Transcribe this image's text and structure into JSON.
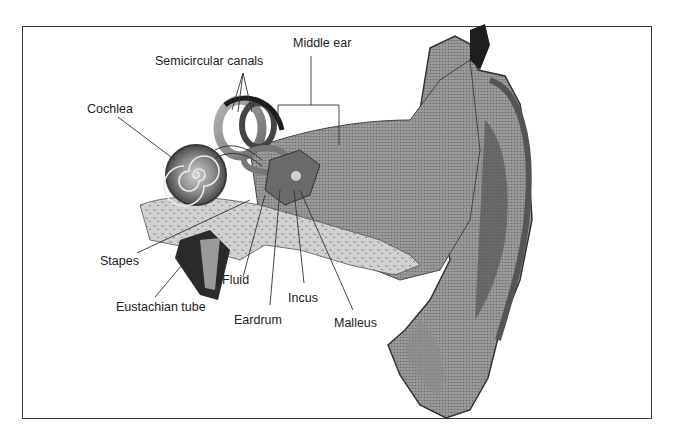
{
  "diagram": {
    "labels": {
      "middle_ear": "Middle ear",
      "semicircular_canals": "Semicircular canals",
      "cochlea": "Cochlea",
      "stapes": "Stapes",
      "eustachian_tube": "Eustachian tube",
      "fluid": "Fluid",
      "eardrum": "Eardrum",
      "incus": "Incus",
      "malleus": "Malleus"
    }
  }
}
